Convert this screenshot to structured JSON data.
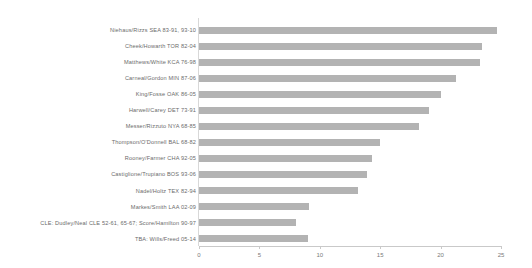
{
  "chart": {
    "background_color": "#ffffff",
    "bar_color": "#b3b3b3",
    "axis_color": "#c9c9c9",
    "label_color": "#6b6b6b"
  },
  "chart_data": {
    "type": "bar",
    "orientation": "horizontal",
    "title": "",
    "subtitle": "",
    "xlabel": "",
    "ylabel": "",
    "grid": false,
    "legend": null,
    "xlim": [
      0,
      25
    ],
    "xticks": [
      0,
      5,
      10,
      15,
      20,
      25
    ],
    "xtick_labels": [
      "0",
      "5",
      "10",
      "15",
      "20",
      "25"
    ],
    "categories": [
      "Niehaus/Rizzs SEA 83-91, 93-10",
      "Cheek/Howarth TOR 82-04",
      "Matthews/White KCA 76-98",
      "Carneal/Gordon MIN 87-06",
      "King/Fosse OAK 86-05",
      "Harwell/Carey DET 73-91",
      "Messer/Rizzuto NYA 68-85",
      "Thompson/O'Donnell BAL 68-82",
      "Rooney/Farmer CHA 92-05",
      "Castiglione/Trupiano BOS 93-06",
      "Nadel/Holtz TEX 82-94",
      "Markes/Smith LAA 02-09",
      "CLE: Dudley/Neal CLE 52-61, 65-67; Score/Hamilton 90-97",
      "TBA: Wills/Freed 05-14"
    ],
    "values": [
      24.7,
      23.4,
      23.3,
      21.3,
      20.0,
      19.0,
      18.2,
      15.0,
      14.3,
      13.9,
      13.2,
      9.1,
      8.0,
      9.0
    ]
  }
}
